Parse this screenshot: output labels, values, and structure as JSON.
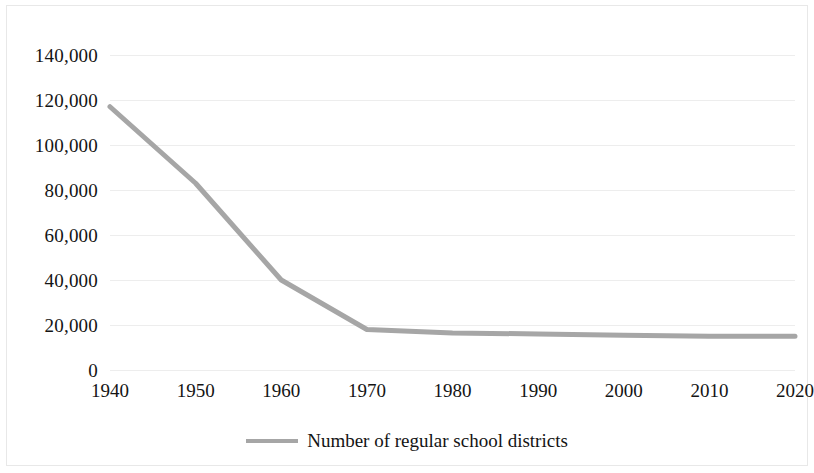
{
  "chart_data": {
    "type": "line",
    "title": "",
    "subtitle": "",
    "xlabel": "",
    "ylabel": "",
    "x": [
      1940,
      1950,
      1960,
      1970,
      1980,
      1990,
      2000,
      2010,
      2020
    ],
    "categories": [
      "1940",
      "1950",
      "1960",
      "1970",
      "1980",
      "1990",
      "2000",
      "2010",
      "2020"
    ],
    "series": [
      {
        "name": "Number of regular school districts",
        "values": [
          117000,
          83000,
          40000,
          18000,
          16500,
          16000,
          15500,
          15000,
          15000
        ],
        "color": "#a6a6a6"
      }
    ],
    "xtick_labels": [
      "1940",
      "1950",
      "1960",
      "1970",
      "1980",
      "1990",
      "2000",
      "2010",
      "2020"
    ],
    "ytick_labels": [
      "140,000",
      "120,000",
      "100,000",
      "80,000",
      "60,000",
      "40,000",
      "20,000",
      "0"
    ],
    "ytick_values": [
      140000,
      120000,
      100000,
      80000,
      60000,
      40000,
      20000,
      0
    ],
    "ylim": [
      0,
      140000
    ],
    "xlim": [
      1940,
      2020
    ],
    "grid": "horizontal",
    "grid_color": "#ededed",
    "legend_position": "bottom",
    "legend_entries": [
      "Number of regular school districts"
    ],
    "background_color": "#ffffff"
  },
  "legend": {
    "label": "Number of regular school districts",
    "swatch_name": "line-swatch"
  }
}
